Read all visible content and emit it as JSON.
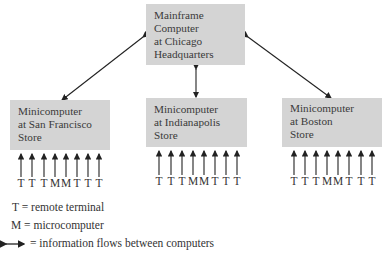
{
  "mainframe": {
    "lines": [
      "Mainframe",
      "Computer",
      "at Chicago",
      "Headquarters"
    ]
  },
  "stores": [
    {
      "lines": [
        "Minicomputer",
        "at San Francisco",
        "Store"
      ],
      "terminals": [
        "T",
        "T",
        "T",
        "M",
        "M",
        "T",
        "T",
        "T"
      ]
    },
    {
      "lines": [
        "Minicomputer",
        "at Indianapolis",
        "Store"
      ],
      "terminals": [
        "T",
        "T",
        "T",
        "M",
        "M",
        "T",
        "T",
        "T"
      ]
    },
    {
      "lines": [
        "Minicomputer",
        "at Boston",
        "Store"
      ],
      "terminals": [
        "T",
        "T",
        "T",
        "M",
        "M",
        "T",
        "T",
        "T"
      ]
    }
  ],
  "legend": {
    "t": "T = remote terminal",
    "m": "M = microcomputer",
    "arrow": "= information flows between computers"
  },
  "colors": {
    "box": "#d4d4d4",
    "line": "#222222"
  }
}
